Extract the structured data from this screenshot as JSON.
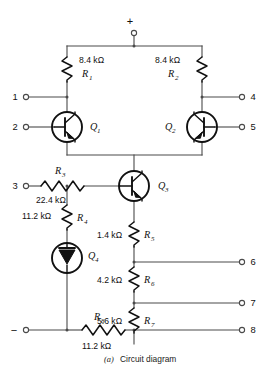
{
  "figure": {
    "caption_marker": "(a)",
    "caption_text": "Circuit diagram",
    "supply_plus": "+",
    "supply_minus": "−"
  },
  "terminals": [
    {
      "id": "t1",
      "label": "1",
      "side": "left"
    },
    {
      "id": "t2",
      "label": "2",
      "side": "left"
    },
    {
      "id": "t3",
      "label": "3",
      "side": "left"
    },
    {
      "id": "t4",
      "label": "4",
      "side": "right"
    },
    {
      "id": "t5",
      "label": "5",
      "side": "right"
    },
    {
      "id": "t6",
      "label": "6",
      "side": "right"
    },
    {
      "id": "t7",
      "label": "7",
      "side": "right"
    },
    {
      "id": "t8",
      "label": "8",
      "side": "right"
    }
  ],
  "resistors": [
    {
      "id": "R1",
      "name": "R",
      "sub": "1",
      "value": "8.4 kΩ",
      "orientation": "vertical"
    },
    {
      "id": "R2",
      "name": "R",
      "sub": "2",
      "value": "8.4 kΩ",
      "orientation": "vertical"
    },
    {
      "id": "R3",
      "name": "R",
      "sub": "3",
      "value": "22.4 kΩ",
      "orientation": "horizontal"
    },
    {
      "id": "R4",
      "name": "R",
      "sub": "4",
      "value": "11.2 kΩ",
      "orientation": "vertical"
    },
    {
      "id": "R5",
      "name": "R",
      "sub": "5",
      "value": "1.4 kΩ",
      "orientation": "vertical"
    },
    {
      "id": "R6",
      "name": "R",
      "sub": "6",
      "value": "4.2 kΩ",
      "orientation": "vertical"
    },
    {
      "id": "R7",
      "name": "R",
      "sub": "7",
      "value": "5.6 kΩ",
      "orientation": "vertical"
    },
    {
      "id": "R8",
      "name": "R",
      "sub": "8",
      "value": "11.2 kΩ",
      "orientation": "horizontal"
    }
  ],
  "transistors": [
    {
      "id": "Q1",
      "name": "Q",
      "sub": "1",
      "symbol": "bjt"
    },
    {
      "id": "Q2",
      "name": "Q",
      "sub": "2",
      "symbol": "bjt"
    },
    {
      "id": "Q3",
      "name": "Q",
      "sub": "3",
      "symbol": "bjt"
    },
    {
      "id": "Q4",
      "name": "Q",
      "sub": "4",
      "symbol": "diode-connected"
    }
  ],
  "colors": {
    "wire": "#4a4a4a",
    "device": "#111111",
    "text": "#111111",
    "background": "#ffffff"
  }
}
